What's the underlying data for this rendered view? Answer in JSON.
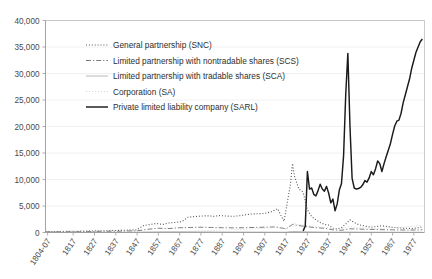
{
  "chart_data": {
    "type": "line",
    "title": "",
    "subtitle": "",
    "xlabel": "",
    "ylabel": "",
    "ylim": [
      0,
      40000
    ],
    "grid": true,
    "legend_position": "inside-top-left",
    "ytick_labels": [
      "0",
      "5,000",
      "10,000",
      "15,000",
      "20,000",
      "25,000",
      "30,000",
      "35,000",
      "40,000"
    ],
    "ytick_values": [
      0,
      5000,
      10000,
      15000,
      20000,
      25000,
      30000,
      35000,
      40000
    ],
    "xtick_labels": [
      "1804-07",
      "1817",
      "1827",
      "1837",
      "1847",
      "1857",
      "1867",
      "1877",
      "1887",
      "1897",
      "1907",
      "1917",
      "1927",
      "1937",
      "1947",
      "1957",
      "1967",
      "1977"
    ],
    "xtick_values": [
      1805,
      1817,
      1827,
      1837,
      1847,
      1857,
      1867,
      1877,
      1887,
      1897,
      1907,
      1917,
      1927,
      1937,
      1947,
      1957,
      1967,
      1977
    ],
    "xlim": [
      1804,
      1982
    ],
    "series": [
      {
        "name": "General partnership (SNC)",
        "legend_label": "General partnership (SNC)",
        "style": "dotted",
        "color": "#555555",
        "x": [
          1804,
          1807,
          1812,
          1817,
          1822,
          1827,
          1832,
          1837,
          1842,
          1847,
          1850,
          1853,
          1856,
          1859,
          1862,
          1865,
          1868,
          1871,
          1874,
          1877,
          1880,
          1883,
          1886,
          1889,
          1892,
          1895,
          1898,
          1901,
          1904,
          1907,
          1910,
          1913,
          1916,
          1919,
          1920,
          1921,
          1923,
          1925,
          1927,
          1929,
          1931,
          1933,
          1935,
          1937,
          1939,
          1941,
          1943,
          1945,
          1947,
          1949,
          1951,
          1953,
          1955,
          1957,
          1959,
          1961,
          1963,
          1965,
          1967,
          1969,
          1971,
          1973,
          1975,
          1977,
          1979,
          1981
        ],
        "y": [
          160,
          180,
          200,
          230,
          260,
          300,
          340,
          380,
          430,
          520,
          1300,
          1500,
          1700,
          1500,
          1800,
          1900,
          2050,
          2900,
          3000,
          3100,
          3150,
          3050,
          3200,
          3100,
          3050,
          3150,
          3350,
          3500,
          3550,
          3600,
          3900,
          4500,
          2100,
          9000,
          13000,
          10500,
          8200,
          7600,
          4300,
          3000,
          2400,
          1900,
          1500,
          1400,
          800,
          700,
          900,
          1600,
          2400,
          1900,
          1500,
          1300,
          1150,
          1000,
          1100,
          1250,
          1200,
          1100,
          1000,
          900,
          850,
          800,
          780,
          760,
          900,
          1100
        ]
      },
      {
        "name": "Limited partnership with nontradable shares (SCS)",
        "legend_label": "Limited partnership with nontradable shares (SCS)",
        "style": "dash-dot",
        "color": "#7d7d7d",
        "x": [
          1804,
          1812,
          1820,
          1827,
          1835,
          1842,
          1847,
          1852,
          1857,
          1862,
          1867,
          1872,
          1877,
          1882,
          1887,
          1892,
          1897,
          1902,
          1907,
          1912,
          1917,
          1920,
          1923,
          1927,
          1931,
          1935,
          1939,
          1943,
          1947,
          1951,
          1955,
          1959,
          1963,
          1967,
          1971,
          1975,
          1979,
          1981
        ],
        "y": [
          120,
          140,
          170,
          200,
          230,
          270,
          320,
          600,
          800,
          750,
          900,
          950,
          1000,
          950,
          900,
          880,
          900,
          950,
          1000,
          1050,
          700,
          1500,
          1300,
          1100,
          900,
          800,
          500,
          420,
          700,
          650,
          600,
          560,
          520,
          500,
          480,
          460,
          480,
          520
        ]
      },
      {
        "name": "Limited partnership with tradable shares (SCA)",
        "legend_label": "Limited partnership with tradable shares (SCA)",
        "style": "solid-light",
        "color": "#b8b8b8",
        "x": [
          1804,
          1817,
          1827,
          1837,
          1847,
          1857,
          1867,
          1877,
          1887,
          1897,
          1907,
          1917,
          1920,
          1927,
          1937,
          1947,
          1957,
          1967,
          1977,
          1981
        ],
        "y": [
          20,
          25,
          30,
          40,
          60,
          120,
          140,
          110,
          90,
          80,
          70,
          60,
          200,
          120,
          60,
          80,
          60,
          50,
          45,
          50
        ]
      },
      {
        "name": "Corporation (SA)",
        "legend_label": "Corporation (SA)",
        "style": "fine-dotted",
        "color": "#c9c9c9",
        "x": [
          1804,
          1817,
          1827,
          1837,
          1847,
          1857,
          1867,
          1877,
          1887,
          1897,
          1907,
          1913,
          1917,
          1920,
          1923,
          1927,
          1931,
          1937,
          1941,
          1947,
          1951,
          1957,
          1961,
          1967,
          1971,
          1977,
          1981
        ],
        "y": [
          10,
          12,
          15,
          20,
          30,
          60,
          110,
          350,
          450,
          600,
          800,
          1000,
          600,
          1800,
          1500,
          1300,
          1100,
          900,
          600,
          1100,
          900,
          800,
          750,
          900,
          1000,
          1200,
          1400
        ]
      },
      {
        "name": "Private limited liability company (SARL)",
        "legend_label": "Private limited liability company (SARL)",
        "style": "solid-bold",
        "color": "#1a1a1a",
        "x": [
          1925,
          1926,
          1927,
          1928,
          1929,
          1930,
          1931,
          1932,
          1933,
          1934,
          1935,
          1936,
          1937,
          1938,
          1939,
          1940,
          1941,
          1942,
          1943,
          1944,
          1945,
          1946,
          1947,
          1948,
          1949,
          1950,
          1951,
          1952,
          1953,
          1954,
          1955,
          1956,
          1957,
          1958,
          1959,
          1960,
          1961,
          1962,
          1963,
          1964,
          1965,
          1966,
          1967,
          1968,
          1969,
          1970,
          1971,
          1972,
          1973,
          1974,
          1975,
          1976,
          1977,
          1978,
          1979,
          1980,
          1981
        ],
        "y": [
          300,
          1200,
          11500,
          8200,
          8400,
          7200,
          6900,
          7900,
          9100,
          8200,
          7800,
          8700,
          7400,
          5600,
          6300,
          4100,
          5400,
          8000,
          9200,
          14500,
          26000,
          33800,
          20000,
          10200,
          8400,
          8200,
          8300,
          8500,
          9000,
          9800,
          9500,
          10300,
          11500,
          10900,
          12000,
          13500,
          13000,
          11500,
          13000,
          14300,
          15500,
          16800,
          18500,
          20100,
          21000,
          21200,
          22500,
          24500,
          26000,
          27500,
          29000,
          31000,
          32500,
          34000,
          35000,
          36000,
          36500
        ]
      }
    ]
  },
  "legend": {
    "entries": [
      {
        "label": "General partnership (SNC)"
      },
      {
        "label": "Limited partnership with nontradable shares (SCS)"
      },
      {
        "label": "Limited partnership with tradable shares (SCA)"
      },
      {
        "label": "Corporation (SA)"
      },
      {
        "label": "Private limited liability company (SARL)"
      }
    ]
  },
  "colors": {
    "background": "#ffffff",
    "gridline": "#ececec",
    "axis": "#9a9a9a",
    "frame": "#bdbdbd",
    "text": "#3a3a3a",
    "snc": "#555555",
    "scs": "#7d7d7d",
    "sca": "#b8b8b8",
    "sa": "#c9c9c9",
    "sarl": "#1a1a1a"
  }
}
